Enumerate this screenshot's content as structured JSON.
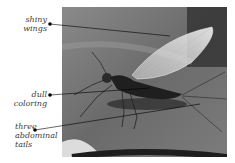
{
  "labels": [
    {
      "id": "wings",
      "text": "shiny\nwings"
    },
    {
      "id": "coloring",
      "text": "dull coloring"
    },
    {
      "id": "tails",
      "text": "three\nabdominal\ntails"
    }
  ],
  "photo": {
    "subject": "mayfly on leaf (grayscale photo)"
  }
}
